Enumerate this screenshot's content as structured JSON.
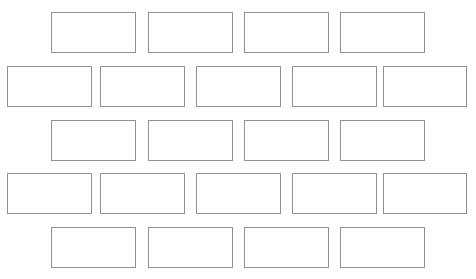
{
  "diagram": {
    "type": "running-bond-brick-grid",
    "canvas": {
      "width": 476,
      "height": 279,
      "background": "#ffffff"
    },
    "style": {
      "brick_fill": "#ffffff",
      "brick_stroke": "#8f8f8f",
      "stroke_width": 1.4
    },
    "row_count": 5,
    "brick_count": 22,
    "rows": [
      {
        "index": 0,
        "offset": "indented",
        "y": 12,
        "height": 41,
        "bricks": [
          {
            "label": "",
            "x": 51,
            "y": 12,
            "w": 85,
            "h": 41
          },
          {
            "label": "",
            "x": 148,
            "y": 12,
            "w": 85,
            "h": 41
          },
          {
            "label": "",
            "x": 244,
            "y": 12,
            "w": 85,
            "h": 41
          },
          {
            "label": "",
            "x": 340,
            "y": 12,
            "w": 85,
            "h": 41
          }
        ]
      },
      {
        "index": 1,
        "offset": "flush",
        "y": 66,
        "height": 41,
        "bricks": [
          {
            "label": "",
            "x": 7,
            "y": 66,
            "w": 85,
            "h": 41
          },
          {
            "label": "",
            "x": 100,
            "y": 66,
            "w": 85,
            "h": 41
          },
          {
            "label": "",
            "x": 196,
            "y": 66,
            "w": 85,
            "h": 41
          },
          {
            "label": "",
            "x": 292,
            "y": 66,
            "w": 85,
            "h": 41
          },
          {
            "label": "",
            "x": 383,
            "y": 66,
            "w": 84,
            "h": 41
          }
        ]
      },
      {
        "index": 2,
        "offset": "indented",
        "y": 120,
        "height": 41,
        "bricks": [
          {
            "label": "",
            "x": 51,
            "y": 120,
            "w": 85,
            "h": 41
          },
          {
            "label": "",
            "x": 148,
            "y": 120,
            "w": 85,
            "h": 41
          },
          {
            "label": "",
            "x": 244,
            "y": 120,
            "w": 85,
            "h": 41
          },
          {
            "label": "",
            "x": 340,
            "y": 120,
            "w": 85,
            "h": 41
          }
        ]
      },
      {
        "index": 3,
        "offset": "flush",
        "y": 173,
        "height": 41,
        "bricks": [
          {
            "label": "",
            "x": 7,
            "y": 173,
            "w": 85,
            "h": 41
          },
          {
            "label": "",
            "x": 100,
            "y": 173,
            "w": 85,
            "h": 41
          },
          {
            "label": "",
            "x": 196,
            "y": 173,
            "w": 85,
            "h": 41
          },
          {
            "label": "",
            "x": 292,
            "y": 173,
            "w": 85,
            "h": 41
          },
          {
            "label": "",
            "x": 383,
            "y": 173,
            "w": 84,
            "h": 41
          }
        ]
      },
      {
        "index": 4,
        "offset": "indented",
        "y": 227,
        "height": 41,
        "bricks": [
          {
            "label": "",
            "x": 51,
            "y": 227,
            "w": 85,
            "h": 41
          },
          {
            "label": "",
            "x": 148,
            "y": 227,
            "w": 85,
            "h": 41
          },
          {
            "label": "",
            "x": 244,
            "y": 227,
            "w": 85,
            "h": 41
          },
          {
            "label": "",
            "x": 340,
            "y": 227,
            "w": 85,
            "h": 41
          }
        ]
      }
    ]
  }
}
